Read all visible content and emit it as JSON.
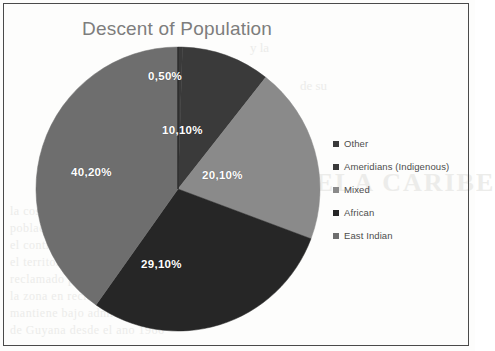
{
  "chart_data": {
    "type": "pie",
    "title": "Descent of Population",
    "categories": [
      "Other",
      "Ameridians (Indigenous)",
      "Mixed",
      "African",
      "East Indian"
    ],
    "values": [
      0.5,
      10.1,
      20.1,
      29.1,
      40.2
    ],
    "value_labels": [
      "0,50%",
      "10,10%",
      "20,10%",
      "29,10%",
      "40,20%"
    ],
    "colors": [
      "#3a3a3a",
      "#3a3a3a",
      "#8a8a8a",
      "#262626",
      "#6e6e6e"
    ],
    "legend_position": "right",
    "grid": false,
    "start_angle": 0,
    "direction": "clockwise",
    "units": "percent",
    "total": 100.0
  },
  "chart": {
    "title": "Descent of Population",
    "labels": {
      "other": "0,50%",
      "ameridians": "10,10%",
      "mixed": "20,10%",
      "african": "29,10%",
      "east_indian": "40,20%"
    }
  },
  "legend": {
    "items": [
      {
        "label": "Other",
        "color": "#3a3a3a"
      },
      {
        "label": "Ameridians (Indigenous)",
        "color": "#3a3a3a"
      },
      {
        "label": "Mixed",
        "color": "#8a8a8a"
      },
      {
        "label": "African",
        "color": "#262626"
      },
      {
        "label": "East Indian",
        "color": "#6e6e6e"
      }
    ]
  },
  "background_text": {
    "b1": "EL VENEZUELA CARIBE",
    "b2": "la costa del Caribe y tiene una",
    "b3": "poblacion de habla inglesa en",
    "b4": "el continente sudamericano",
    "b5": "el territorio del Esequibo es",
    "b6": "reclamado por Venezuela y",
    "b7": "la zona en reclamacion se",
    "b8": "mantiene bajo administracion",
    "b9": "de Guyana desde el ano 1966",
    "b10": "y la",
    "b11": "de su"
  }
}
